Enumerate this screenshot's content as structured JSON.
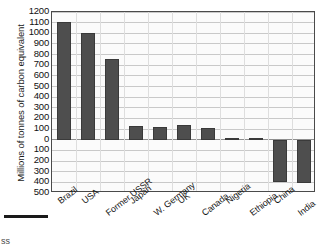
{
  "chart_data": {
    "type": "bar",
    "title": "",
    "xlabel": "",
    "ylabel": "Millions of tonnes of carbon equivalent",
    "ylim": [
      -500,
      1200
    ],
    "ytick_labels": [
      "1200",
      "1100",
      "1000",
      "900",
      "800",
      "700",
      "600",
      "500",
      "400",
      "300",
      "200",
      "100",
      "0",
      "100",
      "200",
      "300",
      "400",
      "500"
    ],
    "ytick_values": [
      1200,
      1100,
      1000,
      900,
      800,
      700,
      600,
      500,
      400,
      300,
      200,
      100,
      0,
      -100,
      -200,
      -300,
      -400,
      -500
    ],
    "grid": true,
    "legend": "none",
    "categories": [
      "Brazil",
      "USA",
      "Former USSR",
      "Japan",
      "W. Germany",
      "UK",
      "Canada",
      "Nigeria",
      "Ethiopia",
      "China",
      "India"
    ],
    "values": [
      1105,
      1000,
      755,
      130,
      120,
      135,
      110,
      20,
      18,
      -400,
      -405
    ],
    "bar_color": "#4e4e4e"
  },
  "footer": {
    "caption_fragment": "ss"
  }
}
